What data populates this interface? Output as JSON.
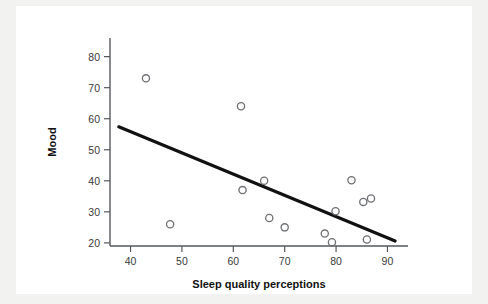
{
  "figure": {
    "background_color": "#f2f2f0",
    "panel_color": "#ffffff",
    "accent_color": "#111111",
    "marker_color": "#6d6f72"
  },
  "chart_data": {
    "type": "scatter",
    "title": "",
    "xlabel": "Sleep quality perceptions",
    "ylabel": "Mood",
    "xlim": [
      36,
      94
    ],
    "ylim": [
      19,
      86
    ],
    "xticks": [
      40,
      50,
      60,
      70,
      80,
      90
    ],
    "yticks": [
      20,
      30,
      40,
      50,
      60,
      70,
      80
    ],
    "xtick_labels": [
      "40",
      "50",
      "60",
      "70",
      "80",
      "90"
    ],
    "ytick_labels": [
      "20",
      "30",
      "40",
      "50",
      "60",
      "70",
      "80"
    ],
    "grid": false,
    "legend": false,
    "points": [
      {
        "x": 43.0,
        "y": 73.0
      },
      {
        "x": 47.7,
        "y": 26.0
      },
      {
        "x": 61.5,
        "y": 64.0
      },
      {
        "x": 61.8,
        "y": 37.0
      },
      {
        "x": 66.0,
        "y": 40.0
      },
      {
        "x": 67.0,
        "y": 28.0
      },
      {
        "x": 70.0,
        "y": 25.0
      },
      {
        "x": 77.8,
        "y": 23.0
      },
      {
        "x": 79.2,
        "y": 20.2
      },
      {
        "x": 79.9,
        "y": 30.2
      },
      {
        "x": 83.0,
        "y": 40.2
      },
      {
        "x": 85.3,
        "y": 33.2
      },
      {
        "x": 86.0,
        "y": 21.1
      },
      {
        "x": 86.8,
        "y": 34.3
      }
    ],
    "fit_line": {
      "name": "linear regression line",
      "x": [
        37.7,
        91.5
      ],
      "y": [
        57.4,
        20.6
      ]
    }
  }
}
